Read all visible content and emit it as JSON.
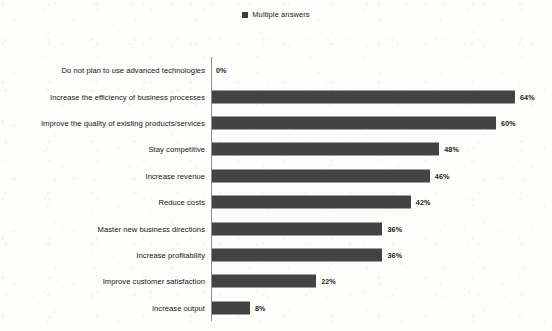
{
  "legend": {
    "marker_name": "legend-swatch",
    "label": "Multiple answers",
    "color": "#3d3d3d"
  },
  "chart_data": {
    "type": "bar",
    "orientation": "horizontal",
    "title": "",
    "subtitle": "",
    "xlabel": "",
    "ylabel": "",
    "xlim": [
      0,
      64
    ],
    "grid": false,
    "legend_position": "top-center",
    "series": [
      {
        "name": "Multiple answers",
        "color": "#434343",
        "values": [
          0,
          64,
          60,
          48,
          46,
          42,
          36,
          36,
          22,
          8
        ]
      }
    ],
    "categories": [
      "Do not plan to use advanced technologies",
      "Increase the efficiency of business processes",
      "Improve the quality of existing products/services",
      "Stay competitive",
      "Increase revenue",
      "Reduce costs",
      "Master new business directions",
      "Increase profitability",
      "Improve customer satisfaction",
      "Increase output"
    ],
    "data_labels": [
      "0%",
      "64%",
      "60%",
      "48%",
      "46%",
      "42%",
      "36%",
      "36%",
      "22%",
      "8%"
    ],
    "rows": [
      {
        "category": "Do not plan to use advanced technologies",
        "value": 0,
        "label": "0%"
      },
      {
        "category": "Increase the efficiency of business processes",
        "value": 64,
        "label": "64%"
      },
      {
        "category": "Improve the quality of existing products/services",
        "value": 60,
        "label": "60%"
      },
      {
        "category": "Stay competitive",
        "value": 48,
        "label": "48%"
      },
      {
        "category": "Increase revenue",
        "value": 46,
        "label": "46%"
      },
      {
        "category": "Reduce costs",
        "value": 42,
        "label": "42%"
      },
      {
        "category": "Master new business directions",
        "value": 36,
        "label": "36%"
      },
      {
        "category": "Increase profitability",
        "value": 36,
        "label": "36%"
      },
      {
        "category": "Improve customer satisfaction",
        "value": 22,
        "label": "22%"
      },
      {
        "category": "Increase output",
        "value": 8,
        "label": "8%"
      }
    ]
  }
}
